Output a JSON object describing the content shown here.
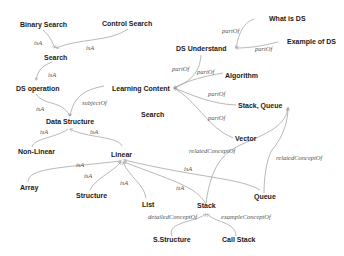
{
  "diagram": {
    "type": "concept-map",
    "nodes": {
      "binary_search": "Binary Search",
      "control_search": "Control Search",
      "search_top": "Search",
      "ds_operation": "DS operation",
      "learning_content": "Learning Content",
      "search_mid": "Search",
      "data_structure": "Data Structure",
      "non_linear": "Non-Linear",
      "linear": "Linear",
      "array": "Array",
      "structure": "Structure",
      "list": "List",
      "stack": "Stack",
      "queue": "Queue",
      "s_structure": "S.Structure",
      "call_stack": "Call Stack",
      "what_is_ds": "What is DS",
      "example_of_ds": "Example of DS",
      "ds_understand": "DS Understand",
      "algorithm": "Algorithm",
      "stack_queue": "Stack, Queue",
      "vector": "Vector"
    },
    "edges": {
      "e1": "isA",
      "e2": "isA",
      "e3": "isA",
      "e4": "subjectOf",
      "e5": "isA",
      "e6": "isA",
      "e7": "isA",
      "e8": "isA",
      "e9": "isA",
      "e10": "isA",
      "e11": "isA",
      "e12": "isA",
      "e13": "partOf",
      "e14": "partOf",
      "e15": "partOf",
      "e16": "partOf",
      "e17": "partOf",
      "e18": "partOf",
      "e19": "relatedConceptOf",
      "e20": "relatedConceptOf",
      "e21": "detailedConceptOf",
      "e22": "exampleConceptOf"
    },
    "edge_list": [
      {
        "from": "Binary Search",
        "to": "Search",
        "label": "isA"
      },
      {
        "from": "Control Search",
        "to": "Search",
        "label": "isA"
      },
      {
        "from": "Search",
        "to": "DS operation",
        "label": "isA"
      },
      {
        "from": "Learning Content",
        "to": "Data Structure",
        "label": "subjectOf"
      },
      {
        "from": "DS operation",
        "to": "Data Structure",
        "label": "isA"
      },
      {
        "from": "Non-Linear",
        "to": "Data Structure",
        "label": "isA"
      },
      {
        "from": "Linear",
        "to": "Data Structure",
        "label": "isA"
      },
      {
        "from": "Array",
        "to": "Linear",
        "label": "isA"
      },
      {
        "from": "Structure",
        "to": "Linear",
        "label": "isA"
      },
      {
        "from": "List",
        "to": "Linear",
        "label": "isA"
      },
      {
        "from": "Queue",
        "to": "Linear",
        "label": "isA"
      },
      {
        "from": "Stack",
        "to": "Linear",
        "label": "isA"
      },
      {
        "from": "What is DS",
        "to": "DS Understand",
        "label": "partOf"
      },
      {
        "from": "Example of DS",
        "to": "DS Understand",
        "label": "partOf"
      },
      {
        "from": "DS Understand",
        "to": "Learning Content",
        "label": "partOf"
      },
      {
        "from": "Algorithm",
        "to": "Learning Content",
        "label": "partOf"
      },
      {
        "from": "Stack, Queue",
        "to": "Learning Content",
        "label": "partOf"
      },
      {
        "from": "Vector",
        "to": "Learning Content",
        "label": "partOf"
      },
      {
        "from": "Stack",
        "to": "Stack, Queue",
        "label": "relatedConceptOf"
      },
      {
        "from": "Queue",
        "to": "Stack, Queue",
        "label": "relatedConceptOf"
      },
      {
        "from": "S.Structure",
        "to": "Stack",
        "label": "detailedConceptOf"
      },
      {
        "from": "Call Stack",
        "to": "Stack",
        "label": "exampleConceptOf"
      }
    ],
    "colors": {
      "node_text": "#1a1a1a",
      "edge_label": "#555555",
      "edge_line": "#9a9a9a",
      "background": "#ffffff"
    }
  }
}
